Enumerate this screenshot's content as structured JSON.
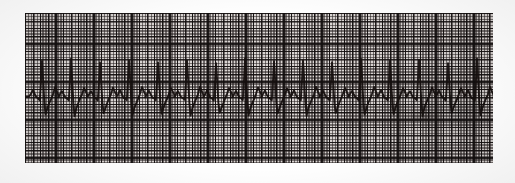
{
  "document": {
    "kind": "ecg-rhythm-strip-scan",
    "title": "Electrocardiogram rhythm strip",
    "background_color": "#ffffff"
  },
  "paper": {
    "label": "ECG graph paper",
    "base_color": "#d9d4d2",
    "grid_line_color": "#282222",
    "bold_grid_line_color": "#120e0e",
    "small_square_px": 1.52,
    "bold_square_px": 7.6,
    "left_px": 25,
    "top_px": 13,
    "width_px": 468,
    "height_px": 150
  },
  "trace": {
    "label": "ECG waveform trace",
    "ink_color": "#16100f",
    "stroke_width_px": 1.9,
    "baseline_y_px": 84,
    "lead_label": "",
    "beat_count": 16
  },
  "artifacts": {
    "smudge_label": "scan smudge"
  },
  "chart_data": {
    "type": "line",
    "subtitle": "",
    "xlabel": "",
    "ylabel": "",
    "grid": true,
    "legend": null,
    "paper_speed_mm_per_s": 25,
    "gain_mm_per_mV": 10,
    "small_box_mm": 1,
    "large_box_mm": 5,
    "xlim": [
      0,
      468
    ],
    "ylim": [
      150,
      0
    ],
    "units": "pixels-on-paper",
    "beat_count": 16,
    "mean_rr_px": 29,
    "baseline_y": 84,
    "series": [
      {
        "name": "ECG lead trace",
        "color": "#16100f",
        "beats": [
          {
            "p_peak_y": 77,
            "r_peak_y": 48,
            "s_trough_y": 101,
            "t_peak_y": 74,
            "r_x": 17
          },
          {
            "p_peak_y": 78,
            "r_peak_y": 46,
            "s_trough_y": 103,
            "t_peak_y": 75,
            "r_x": 46
          },
          {
            "p_peak_y": 78,
            "r_peak_y": 50,
            "s_trough_y": 100,
            "t_peak_y": 75,
            "r_x": 75
          },
          {
            "p_peak_y": 77,
            "r_peak_y": 47,
            "s_trough_y": 102,
            "t_peak_y": 74,
            "r_x": 104
          },
          {
            "p_peak_y": 78,
            "r_peak_y": 49,
            "s_trough_y": 101,
            "t_peak_y": 75,
            "r_x": 133
          },
          {
            "p_peak_y": 78,
            "r_peak_y": 47,
            "s_trough_y": 103,
            "t_peak_y": 74,
            "r_x": 162
          },
          {
            "p_peak_y": 77,
            "r_peak_y": 50,
            "s_trough_y": 100,
            "t_peak_y": 75,
            "r_x": 191
          },
          {
            "p_peak_y": 78,
            "r_peak_y": 46,
            "s_trough_y": 102,
            "t_peak_y": 74,
            "r_x": 220
          },
          {
            "p_peak_y": 78,
            "r_peak_y": 48,
            "s_trough_y": 101,
            "t_peak_y": 75,
            "r_x": 249
          },
          {
            "p_peak_y": 77,
            "r_peak_y": 47,
            "s_trough_y": 103,
            "t_peak_y": 74,
            "r_x": 278
          },
          {
            "p_peak_y": 78,
            "r_peak_y": 49,
            "s_trough_y": 100,
            "t_peak_y": 75,
            "r_x": 307
          },
          {
            "p_peak_y": 78,
            "r_peak_y": 46,
            "s_trough_y": 102,
            "t_peak_y": 74,
            "r_x": 336
          },
          {
            "p_peak_y": 77,
            "r_peak_y": 48,
            "s_trough_y": 101,
            "t_peak_y": 75,
            "r_x": 365
          },
          {
            "p_peak_y": 78,
            "r_peak_y": 47,
            "s_trough_y": 103,
            "t_peak_y": 74,
            "r_x": 394
          },
          {
            "p_peak_y": 78,
            "r_peak_y": 50,
            "s_trough_y": 100,
            "t_peak_y": 75,
            "r_x": 423
          },
          {
            "p_peak_y": 77,
            "r_peak_y": 46,
            "s_trough_y": 102,
            "t_peak_y": 74,
            "r_x": 452
          }
        ]
      }
    ]
  }
}
